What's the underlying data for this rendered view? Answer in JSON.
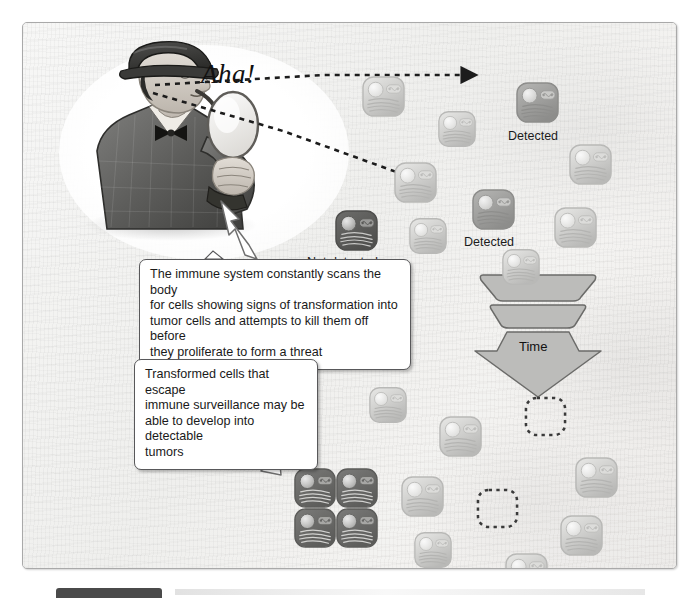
{
  "figure": {
    "exclamation": "Aha!",
    "detective_alt": "Sherlock Holmes detective with deerstalker hat, pipe and magnifying glass"
  },
  "labels": {
    "detected_top": "Detected",
    "detected_mid": "Detected",
    "not_detected": "Not detected",
    "time": "Time"
  },
  "callouts": [
    {
      "id": "immune-surveillance",
      "lines": [
        "The immune system constantly scans the body",
        "for cells showing signs of transformation into",
        "tumor cells and attempts to kill them off before",
        "they proliferate to form a threat"
      ]
    },
    {
      "id": "escape-surveillance",
      "lines": [
        "Transformed cells that escape",
        "immune surveillance may be",
        "able to develop into detectable",
        "tumors"
      ]
    }
  ],
  "colors": {
    "panel_bg": "#f3f3f1",
    "panel_border": "#a9a9a9",
    "cell_light_fill": "#e9e9e7",
    "cell_light_stroke": "#b9b9b7",
    "cell_detected_fill": "#b6b6b4",
    "cell_detected_stroke": "#8d8d8b",
    "cell_dark_fill": "#6d6d6b",
    "cell_dark_stroke": "#4f4f4d",
    "tumor_fill": "#7b7b79",
    "dashed_outline": "#3a3a3a",
    "arrow_fill": "#ffffff",
    "arrow_stroke": "#6f6f6f",
    "time_arrow_fill": "#b9b9b7",
    "time_arrow_stroke": "#6b6b69",
    "text": "#1a1a1a"
  },
  "cells": [
    {
      "id": "c1",
      "x": 338,
      "y": 52,
      "style": "light",
      "size": "big"
    },
    {
      "id": "c2",
      "x": 414,
      "y": 87,
      "style": "light",
      "size": "normal"
    },
    {
      "id": "c3",
      "x": 492,
      "y": 58,
      "style": "detected",
      "size": "big"
    },
    {
      "id": "c4",
      "x": 545,
      "y": 120,
      "style": "light",
      "size": "big"
    },
    {
      "id": "c5",
      "x": 370,
      "y": 138,
      "style": "light",
      "size": "big"
    },
    {
      "id": "c6",
      "x": 311,
      "y": 186,
      "style": "dark",
      "size": "big"
    },
    {
      "id": "c7",
      "x": 385,
      "y": 194,
      "style": "light",
      "size": "normal"
    },
    {
      "id": "c8",
      "x": 448,
      "y": 165,
      "style": "detected",
      "size": "big"
    },
    {
      "id": "c9",
      "x": 530,
      "y": 183,
      "style": "light",
      "size": "big"
    },
    {
      "id": "c10",
      "x": 478,
      "y": 225,
      "style": "light",
      "size": "normal"
    },
    {
      "id": "c11",
      "x": 345,
      "y": 363,
      "style": "light",
      "size": "normal"
    },
    {
      "id": "c12",
      "x": 415,
      "y": 392,
      "style": "light",
      "size": "big"
    },
    {
      "id": "c13",
      "x": 377,
      "y": 452,
      "style": "light",
      "size": "big"
    },
    {
      "id": "c14",
      "x": 390,
      "y": 508,
      "style": "light",
      "size": "normal"
    },
    {
      "id": "c15",
      "x": 551,
      "y": 433,
      "style": "light",
      "size": "big"
    },
    {
      "id": "c16",
      "x": 536,
      "y": 491,
      "style": "light",
      "size": "big"
    },
    {
      "id": "c17",
      "x": 481,
      "y": 529,
      "style": "light",
      "size": "big"
    }
  ],
  "dashed_cells": [
    {
      "id": "d1",
      "x": 500,
      "y": 372
    },
    {
      "id": "d2",
      "x": 452,
      "y": 464
    }
  ],
  "tumor_cluster": {
    "x": 270,
    "y": 444,
    "rows": 2,
    "cols": 2,
    "cell_w": 44,
    "cell_h": 42
  }
}
